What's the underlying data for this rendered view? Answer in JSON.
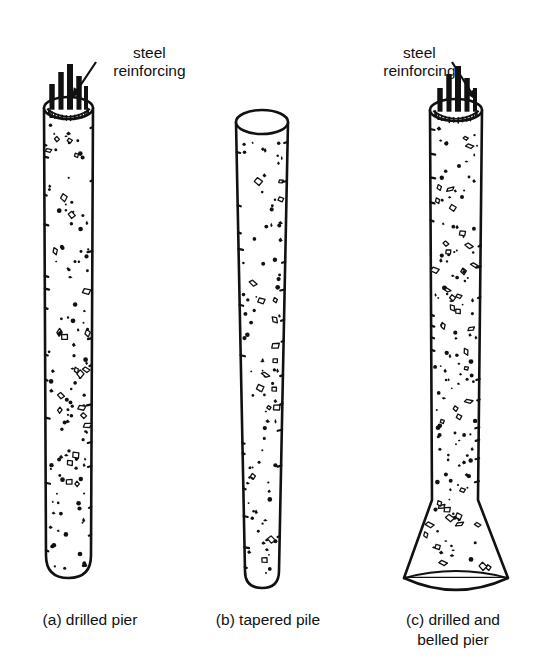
{
  "figure": {
    "background": "#ffffff",
    "ink": "#111111",
    "concrete_fill": "#ffffff"
  },
  "callouts": [
    {
      "id": "callout-a",
      "name": "steel-reinforcing-label-a",
      "line1": "steel",
      "line2": "reinforcing",
      "leader": {
        "x1": 96,
        "y1": 62,
        "x2": 72,
        "y2": 98
      }
    },
    {
      "id": "callout-c",
      "name": "steel-reinforcing-label-c",
      "line1": "steel",
      "line2": "reinforcing",
      "leader": {
        "x1": 452,
        "y1": 62,
        "x2": 476,
        "y2": 100
      }
    }
  ],
  "captions": [
    {
      "id": "caption-a",
      "name": "caption-drilled-pier",
      "line1": "(a) drilled pier",
      "line2": ""
    },
    {
      "id": "caption-b",
      "name": "caption-tapered-pile",
      "line1": "(b) tapered pile",
      "line2": ""
    },
    {
      "id": "caption-c",
      "name": "caption-belled-pier",
      "line1": "(c) drilled and",
      "line2": "belled pier"
    }
  ],
  "elements": [
    {
      "key": "drilled_pier",
      "name": "drilled-pier-drawing",
      "type": "straight-shaft",
      "top_y": 108,
      "bottom_y": 578,
      "top_left_x": 44,
      "top_right_x": 93,
      "bottom_left_x": 46,
      "bottom_right_x": 91,
      "top_ellipse_ry": 11,
      "bottom_round": true,
      "has_rebar": true,
      "rebar": [
        {
          "x": 52,
          "top": 84,
          "bottom": 118,
          "w": 5
        },
        {
          "x": 61,
          "top": 72,
          "bottom": 116,
          "w": 5
        },
        {
          "x": 70,
          "top": 64,
          "bottom": 120,
          "w": 6
        },
        {
          "x": 79,
          "top": 76,
          "bottom": 114,
          "w": 5
        },
        {
          "x": 86,
          "top": 86,
          "bottom": 112,
          "w": 4
        }
      ],
      "speckle_seed": 11,
      "speckle_count": 130
    },
    {
      "key": "tapered_pile",
      "name": "tapered-pile-drawing",
      "type": "tapered-shaft",
      "top_y": 122,
      "bottom_y": 588,
      "top_left_x": 236,
      "top_right_x": 288,
      "bottom_left_x": 245,
      "bottom_right_x": 279,
      "top_ellipse_ry": 12,
      "bottom_round": true,
      "has_rebar": false,
      "speckle_seed": 29,
      "speckle_count": 96
    },
    {
      "key": "belled_pier",
      "name": "belled-pier-drawing",
      "type": "belled-shaft",
      "top_y": 110,
      "bottom_y": 588,
      "top_left_x": 430,
      "top_right_x": 482,
      "bottom_left_x": 432,
      "bottom_right_x": 478,
      "top_ellipse_ry": 11,
      "bell_start_y": 500,
      "bell_bottom_y": 578,
      "bell_left_x": 404,
      "bell_right_x": 508,
      "bell_base_ry": 14,
      "has_rebar": true,
      "rebar": [
        {
          "x": 440,
          "top": 88,
          "bottom": 120,
          "w": 5
        },
        {
          "x": 449,
          "top": 74,
          "bottom": 118,
          "w": 5
        },
        {
          "x": 458,
          "top": 66,
          "bottom": 122,
          "w": 6
        },
        {
          "x": 467,
          "top": 78,
          "bottom": 116,
          "w": 5
        },
        {
          "x": 475,
          "top": 88,
          "bottom": 114,
          "w": 4
        }
      ],
      "speckle_seed": 47,
      "speckle_count": 150
    }
  ]
}
